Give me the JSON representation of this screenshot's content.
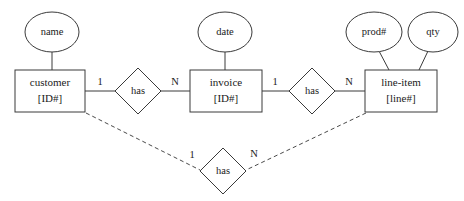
{
  "diagram": {
    "type": "entity-relationship-diagram",
    "background_color": "#ffffff",
    "line_color": "#3a3a3a",
    "text_color": "#1a1a1a",
    "entities": [
      {
        "id": "customer",
        "name": "customer",
        "key": "[ID#]"
      },
      {
        "id": "invoice",
        "name": "invoice",
        "key": "[ID#]"
      },
      {
        "id": "line-item",
        "name": "line-item",
        "key": "[line#]"
      }
    ],
    "attributes": [
      {
        "id": "name",
        "label": "name",
        "owner": "customer"
      },
      {
        "id": "date",
        "label": "date",
        "owner": "invoice"
      },
      {
        "id": "prod",
        "label": "prod#",
        "owner": "line-item"
      },
      {
        "id": "qty",
        "label": "qty",
        "owner": "line-item"
      }
    ],
    "relationships": [
      {
        "id": "rel-customer-invoice",
        "label": "has",
        "from": "customer",
        "to": "invoice",
        "from_cardinality": "1",
        "to_cardinality": "N",
        "style": "solid"
      },
      {
        "id": "rel-invoice-lineitem",
        "label": "has",
        "from": "invoice",
        "to": "line-item",
        "from_cardinality": "1",
        "to_cardinality": "N",
        "style": "solid"
      },
      {
        "id": "rel-customer-lineitem",
        "label": "has",
        "from": "customer",
        "to": "line-item",
        "from_cardinality": "1",
        "to_cardinality": "N",
        "style": "dashed"
      }
    ]
  }
}
